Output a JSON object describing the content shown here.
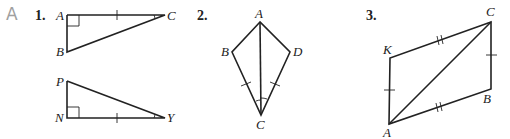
{
  "section": {
    "letter": "A",
    "color": "#a0a0a0"
  },
  "problems": [
    {
      "number": "1.",
      "figures": [
        {
          "type": "right-triangle",
          "vertices": {
            "A": "right angle",
            "B": "",
            "C": ""
          },
          "labels": [
            "A",
            "B",
            "C"
          ],
          "marks": "AC has single tick; angle C marked"
        },
        {
          "type": "right-triangle",
          "vertices": {
            "N": "right angle",
            "P": "",
            "Y": ""
          },
          "labels": [
            "P",
            "N",
            "Y"
          ],
          "marks": "NY has single tick; angle Y marked"
        }
      ]
    },
    {
      "number": "2.",
      "figures": [
        {
          "type": "kite",
          "labels": [
            "A",
            "B",
            "D",
            "C"
          ],
          "marks": "BC and DC have single ticks; angles BCA and DCA marked; diagonal AC drawn"
        }
      ]
    },
    {
      "number": "3.",
      "figures": [
        {
          "type": "quadrilateral",
          "labels": [
            "C",
            "K",
            "B",
            "A"
          ],
          "marks": "KC and AB have double ticks; AK and CB have single ticks; diagonal AC drawn"
        }
      ]
    }
  ]
}
